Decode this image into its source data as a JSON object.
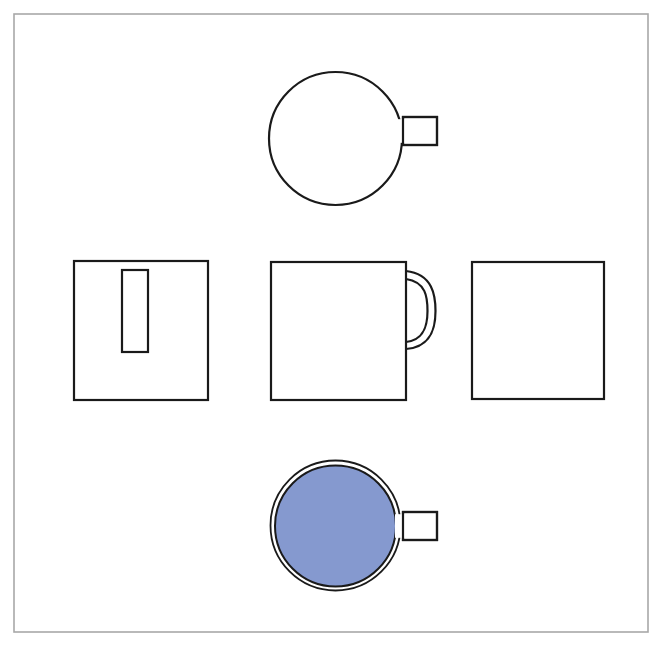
{
  "sheet": {
    "width": 669,
    "height": 648,
    "background_color": "#ffffff",
    "border": {
      "name": "drawing-sheet-border",
      "x": 14,
      "y": 14,
      "width": 634,
      "height": 618,
      "stroke_color": "#a8a8a8",
      "stroke_width": 1.6,
      "fill": "none"
    }
  },
  "style": {
    "line_color": "#1a1a1a",
    "line_width": 2.2,
    "thin_line_width": 1.6,
    "fill_none": "none",
    "fill_white": "#ffffff",
    "accent_blue": "#8599cf",
    "accent_blue_stroke": "#8599cf"
  },
  "drawing": {
    "type": "orthographic-multiview-projection",
    "subject": "coffee-mug",
    "view_count": 5,
    "layout": "cross-arrangement"
  },
  "views": {
    "top": {
      "name": "top-view",
      "label": "top view",
      "body": {
        "shape": "circle",
        "cx": 335.5,
        "cy": 138.5,
        "r": 66.5,
        "fill": "none"
      },
      "handle": {
        "shape": "rectangle",
        "x": 403,
        "y": 117,
        "width": 34,
        "height": 28,
        "fill": "#ffffff"
      }
    },
    "left": {
      "name": "left-side-view",
      "label": "left side view",
      "body": {
        "shape": "rectangle",
        "x": 74,
        "y": 261,
        "width": 134,
        "height": 139,
        "fill": "none"
      },
      "handle_section": {
        "shape": "rectangle",
        "x": 122,
        "y": 270,
        "width": 26,
        "height": 82,
        "fill": "none"
      }
    },
    "front": {
      "name": "front-view",
      "label": "front view",
      "body": {
        "shape": "rectangle",
        "x": 271,
        "y": 262,
        "width": 135,
        "height": 138,
        "fill": "none"
      },
      "handle_outer": {
        "shape": "arc",
        "path": "M 406 271 C 433 274 435.5 296 435.5 311 C 435.5 327 432 347 406 349",
        "fill": "none"
      },
      "handle_inner": {
        "shape": "arc",
        "path": "M 406 279 C 426 282 427.5 297 427.5 311 C 427.5 325 424.5 340 406 342",
        "fill": "none"
      }
    },
    "right": {
      "name": "right-side-view",
      "label": "right side view",
      "body": {
        "shape": "rectangle",
        "x": 472,
        "y": 262,
        "width": 132,
        "height": 137,
        "fill": "none"
      }
    },
    "bottom": {
      "name": "bottom-view",
      "label": "bottom view",
      "outer_ring": {
        "shape": "circle",
        "cx": 335.5,
        "cy": 525.5,
        "r": 65,
        "fill": "none"
      },
      "base": {
        "shape": "circle",
        "cx": 335.5,
        "cy": 526,
        "r": 60.5,
        "fill": "#8599cf"
      },
      "handle": {
        "shape": "rectangle",
        "x": 403,
        "y": 512,
        "width": 34,
        "height": 28,
        "fill": "#ffffff"
      }
    }
  }
}
